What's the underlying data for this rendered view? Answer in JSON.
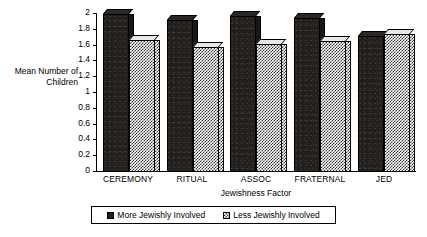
{
  "chart_data": {
    "type": "bar",
    "title": "",
    "xlabel": "Jewishness Factor",
    "ylabel": "Mean Number of\nChildren",
    "categories": [
      "CEREMONY",
      "RITUAL",
      "ASSOC",
      "FRATERNAL",
      "JED"
    ],
    "series": [
      {
        "name": "More Jewishly Involved",
        "values": [
          2.0,
          1.93,
          1.97,
          1.95,
          1.72
        ]
      },
      {
        "name": "Less Jewishly Involved",
        "values": [
          1.67,
          1.58,
          1.62,
          1.66,
          1.75
        ]
      }
    ],
    "ylim": [
      0,
      2
    ],
    "yticks": [
      0,
      0.2,
      0.4,
      0.6,
      0.8,
      1,
      1.2,
      1.4,
      1.6,
      1.8,
      2
    ],
    "ytick_labels": [
      "0",
      "0.2",
      "0.4",
      "0.6",
      "0.8",
      "1",
      "1.2",
      "1.4",
      "1.6",
      "1.8",
      "2"
    ],
    "grid": false,
    "legend_position": "bottom",
    "colors": {
      "series_more": "#231f1d",
      "series_less": "#ffffff",
      "axis": "#000000",
      "background": "#ffffff"
    }
  },
  "axes": {
    "y_title": "Mean Number of\nChildren",
    "x_title": "Jewishness Factor"
  },
  "legend": {
    "items": [
      {
        "label": "More Jewishly Involved",
        "style": "dark"
      },
      {
        "label": "Less Jewishly Involved",
        "style": "checker"
      }
    ]
  }
}
